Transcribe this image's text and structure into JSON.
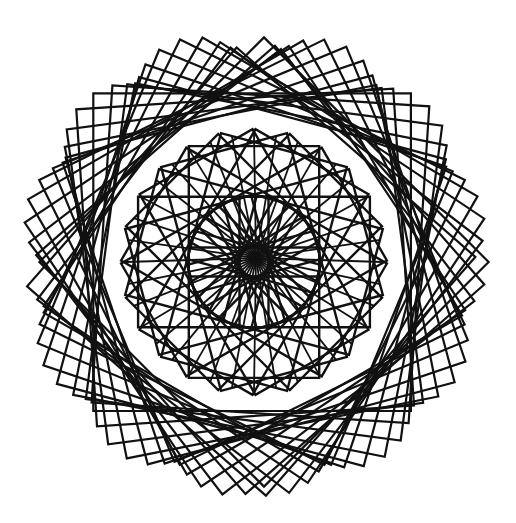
{
  "figure": {
    "background": "#ffffff",
    "stroke_color": "#111111",
    "center": [
      254,
      262
    ],
    "outer_ring": {
      "count": 24,
      "radius": 228,
      "rotation_step_deg": 3.75,
      "offset_radius": 10,
      "stroke_width": 2.2
    },
    "inner_ring": {
      "count": 24,
      "radius": 128,
      "rotation_step_deg": 15,
      "stroke_width": 2.4
    },
    "spokes": {
      "count": 36,
      "hub": [
        256,
        258
      ],
      "stroke_width": 1.8
    }
  }
}
